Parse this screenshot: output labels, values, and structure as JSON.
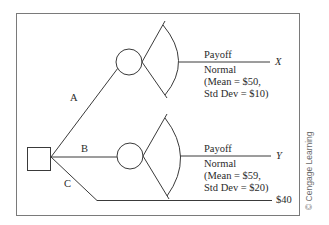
{
  "diagram": {
    "type": "decision-tree",
    "decision_node": {
      "shape": "square"
    },
    "branches": [
      {
        "label": "A",
        "node": "chance",
        "payoff_label": "Payoff",
        "outcome_var": "X",
        "distribution": {
          "name": "Normal",
          "line1": "(Mean = $50,",
          "line2": "Std Dev = $10)",
          "mean": 50,
          "std_dev": 10
        }
      },
      {
        "label": "B",
        "node": "chance",
        "payoff_label": "Payoff",
        "outcome_var": "Y",
        "distribution": {
          "name": "Normal",
          "line1": "(Mean = $59,",
          "line2": "Std Dev = $20)",
          "mean": 59,
          "std_dev": 20
        }
      },
      {
        "label": "C",
        "node": "terminal",
        "payoff": "$40"
      }
    ]
  },
  "credit": "© Cengage Learning",
  "colors": {
    "line": "#3a3a3a",
    "frame": "#7a7a7a",
    "text": "#2a2a2a"
  }
}
